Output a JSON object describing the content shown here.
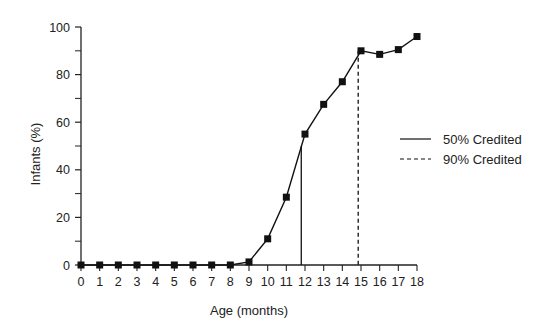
{
  "chart_data": {
    "type": "line",
    "title": "",
    "xlabel": "Age (months)",
    "ylabel": "Infants (%)",
    "xlim": [
      0,
      18
    ],
    "ylim": [
      0,
      100
    ],
    "x_ticks": [
      0,
      1,
      2,
      3,
      4,
      5,
      6,
      7,
      8,
      9,
      10,
      11,
      12,
      13,
      14,
      15,
      16,
      17,
      18
    ],
    "y_ticks": [
      0,
      20,
      40,
      60,
      80,
      100
    ],
    "y_minor_ticks": [
      10,
      30,
      50,
      70,
      90
    ],
    "grid": false,
    "series": [
      {
        "name": "Infants credited",
        "marker": "square",
        "x": [
          0,
          1,
          2,
          3,
          4,
          5,
          6,
          7,
          8,
          9,
          10,
          11,
          12,
          13,
          14,
          15,
          16,
          17,
          18
        ],
        "values": [
          0,
          0,
          0,
          0,
          0,
          0,
          0,
          0,
          0,
          1.3,
          11,
          28.5,
          55,
          67.5,
          77,
          90,
          88.5,
          90.5,
          96
        ]
      }
    ],
    "reference_lines": [
      {
        "name": "50% Credited",
        "style": "solid",
        "x": 11.8,
        "y_top": 50
      },
      {
        "name": "90% Credited",
        "style": "dashed",
        "x": 14.85,
        "y_top": 90
      }
    ],
    "legend": {
      "placement": "right",
      "entries": [
        {
          "label": "50% Credited",
          "style": "solid"
        },
        {
          "label": "90% Credited",
          "style": "dashed"
        }
      ]
    },
    "colors": {
      "line": "#111111",
      "marker": "#111111",
      "axis": "#222222",
      "text": "#222222"
    }
  }
}
